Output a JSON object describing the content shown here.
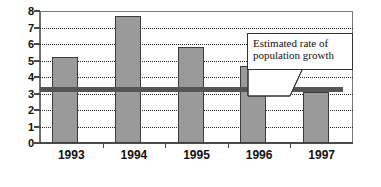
{
  "chart_data": {
    "type": "bar",
    "title": "",
    "subtitle": "",
    "xlabel": "",
    "ylabel": "",
    "categories": [
      "1993",
      "1994",
      "1995",
      "1996",
      "1997"
    ],
    "values": [
      5.2,
      7.7,
      5.8,
      4.65,
      3.1
    ],
    "series": [
      {
        "name": "Annual value",
        "values": [
          5.2,
          7.7,
          5.8,
          4.65,
          3.1
        ],
        "color": "#9a9a9a"
      }
    ],
    "ylim": [
      0,
      8
    ],
    "yticks": [
      0,
      1,
      2,
      3,
      4,
      5,
      6,
      7,
      8
    ],
    "ytick_labels": [
      "0",
      "1",
      "2",
      "3",
      "4",
      "5",
      "6",
      "7",
      "8"
    ],
    "grid": true,
    "grid_style": "dotted-horizontal",
    "legend": "none",
    "reference_line": {
      "label_line_1": "Estimated rate of",
      "label_line_2": "population growth",
      "value": 3.3,
      "color": "#555555"
    },
    "annotations": [
      {
        "kind": "callout",
        "text_line_1": "Estimated rate of",
        "text_line_2": "population growth",
        "points_to": "reference-line"
      }
    ],
    "colors": {
      "bar_fill": "#9a9a9a",
      "bar_stroke": "#3d3d3d",
      "gridline": "#2b2b2b",
      "axis": "#4a4a4a",
      "reference_line": "#555555",
      "background": "#ffffff",
      "text": "#111111"
    }
  }
}
